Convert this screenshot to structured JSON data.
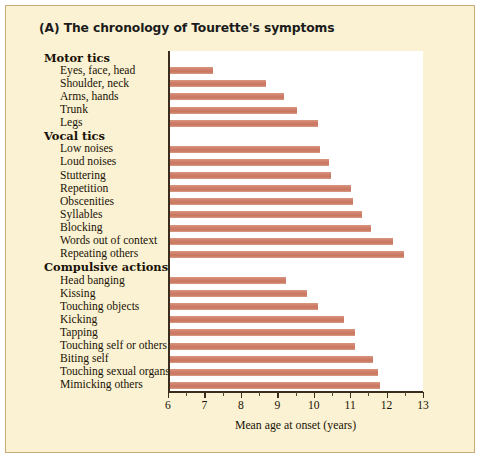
{
  "figure": {
    "panel_letter": "(A)",
    "title": "(A)  The chronology of Tourette's symptoms",
    "background_color": "#faf2d2",
    "border_color": "#c9ab77",
    "plot_background_color": "#ffffff"
  },
  "chart_data": {
    "type": "bar",
    "orientation": "horizontal",
    "title": "The chronology of Tourette's symptoms",
    "xlabel": "Mean age at onset (years)",
    "ylabel": "",
    "xlim": [
      6,
      13
    ],
    "xticks": [
      6,
      7,
      8,
      9,
      10,
      11,
      12,
      13
    ],
    "xtick_labels": [
      "6",
      "7",
      "8",
      "9",
      "10",
      "11",
      "12",
      "13"
    ],
    "minor_tick_interval": 0.5,
    "grid": false,
    "legend": null,
    "bar_color": "#cf7f6b",
    "group_headers": [
      "Motor tics",
      "Vocal tics",
      "Compulsive actions"
    ],
    "categories": [
      "Eyes, face, head",
      "Shoulder, neck",
      "Arms, hands",
      "Trunk",
      "Legs",
      "Low noises",
      "Loud noises",
      "Stuttering",
      "Repetition",
      "Obscenities",
      "Syllables",
      "Blocking",
      "Words out of context",
      "Repeating others",
      "Head banging",
      "Kissing",
      "Touching objects",
      "Kicking",
      "Tapping",
      "Touching self or others",
      "Biting self",
      "Touching sexual organs",
      "Mimicking others"
    ],
    "values": [
      7.2,
      8.65,
      9.15,
      9.5,
      10.1,
      10.15,
      10.4,
      10.45,
      11.0,
      11.05,
      11.3,
      11.55,
      12.15,
      12.45,
      9.2,
      9.8,
      10.1,
      10.8,
      11.1,
      11.1,
      11.6,
      11.75,
      11.8
    ]
  },
  "rows": [
    {
      "kind": "group",
      "label": "Motor tics"
    },
    {
      "kind": "item",
      "label": "Eyes, face, head",
      "value": 7.2
    },
    {
      "kind": "item",
      "label": "Shoulder, neck",
      "value": 8.65
    },
    {
      "kind": "item",
      "label": "Arms, hands",
      "value": 9.15
    },
    {
      "kind": "item",
      "label": "Trunk",
      "value": 9.5
    },
    {
      "kind": "item",
      "label": "Legs",
      "value": 10.1
    },
    {
      "kind": "group",
      "label": "Vocal tics"
    },
    {
      "kind": "item",
      "label": "Low noises",
      "value": 10.15
    },
    {
      "kind": "item",
      "label": "Loud noises",
      "value": 10.4
    },
    {
      "kind": "item",
      "label": "Stuttering",
      "value": 10.45
    },
    {
      "kind": "item",
      "label": "Repetition",
      "value": 11.0
    },
    {
      "kind": "item",
      "label": "Obscenities",
      "value": 11.05
    },
    {
      "kind": "item",
      "label": "Syllables",
      "value": 11.3
    },
    {
      "kind": "item",
      "label": "Blocking",
      "value": 11.55
    },
    {
      "kind": "item",
      "label": "Words out of context",
      "value": 12.15
    },
    {
      "kind": "item",
      "label": "Repeating others",
      "value": 12.45
    },
    {
      "kind": "group",
      "label": "Compulsive actions"
    },
    {
      "kind": "item",
      "label": "Head banging",
      "value": 9.2
    },
    {
      "kind": "item",
      "label": "Kissing",
      "value": 9.8
    },
    {
      "kind": "item",
      "label": "Touching objects",
      "value": 10.1
    },
    {
      "kind": "item",
      "label": "Kicking",
      "value": 10.8
    },
    {
      "kind": "item",
      "label": "Tapping",
      "value": 11.1
    },
    {
      "kind": "item",
      "label": "Touching self or others",
      "value": 11.1
    },
    {
      "kind": "item",
      "label": "Biting self",
      "value": 11.6
    },
    {
      "kind": "item",
      "label": "Touching sexual organs",
      "value": 11.75
    },
    {
      "kind": "item",
      "label": "Mimicking others",
      "value": 11.8
    }
  ],
  "axis": {
    "x_title": "Mean age at onset (years)",
    "ticks": [
      "6",
      "7",
      "8",
      "9",
      "10",
      "11",
      "12",
      "13"
    ]
  }
}
